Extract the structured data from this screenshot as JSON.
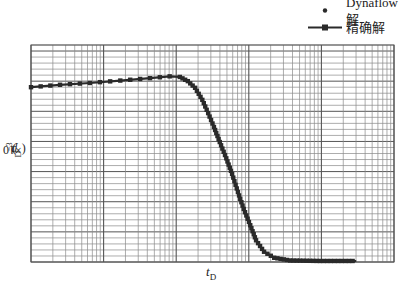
{
  "chart_data": {
    "type": "line",
    "title": "",
    "xlabel": "t_D",
    "ylabel": "p_D(×10^-3)",
    "x_scale": "log",
    "x_decades": 5,
    "x_range_log10": [
      0,
      5
    ],
    "y_range": [
      0,
      36
    ],
    "grid": true,
    "tick_labels_shown": false,
    "legend": {
      "position": "upper-right-outside",
      "entries": [
        "Dynaflow解",
        "精确解"
      ]
    },
    "series": [
      {
        "name": "精确解",
        "style": "line-with-square-markers",
        "x_log10": [
          0,
          0.4,
          0.81,
          1.23,
          1.64,
          1.91,
          2.05,
          2.16,
          2.26,
          2.36,
          2.44,
          2.52,
          2.6,
          2.69,
          2.77,
          2.85,
          2.93,
          3.02,
          3.1,
          3.21,
          3.35,
          3.57,
          3.98,
          4.48
        ],
        "y": [
          29.0,
          29.4,
          29.7,
          30.1,
          30.5,
          30.8,
          30.7,
          30.0,
          28.9,
          26.9,
          24.7,
          22.4,
          19.9,
          17.2,
          14.6,
          11.6,
          8.8,
          6.1,
          3.6,
          1.7,
          0.7,
          0.25,
          0.17,
          0.17
        ]
      },
      {
        "name": "Dynaflow解",
        "style": "diamond-markers",
        "x_log10": [
          0,
          0.4,
          0.81,
          1.23,
          1.64,
          1.91,
          2.05,
          2.16,
          2.26,
          2.36,
          2.44,
          2.52,
          2.6,
          2.69,
          2.77,
          2.85,
          2.93,
          3.02,
          3.1,
          3.21,
          3.35,
          3.57,
          3.98,
          4.48
        ],
        "y": [
          29.0,
          29.4,
          29.7,
          30.1,
          30.5,
          30.8,
          30.7,
          30.0,
          28.9,
          26.9,
          24.7,
          22.4,
          19.9,
          17.2,
          14.6,
          11.6,
          8.8,
          6.1,
          3.6,
          1.7,
          0.7,
          0.25,
          0.17,
          0.17
        ]
      }
    ]
  },
  "legend": {
    "dynaflow_label": "Dynaflow解",
    "exact_label": "精确解"
  },
  "axes": {
    "x_label_main": "t",
    "x_label_sub": "D",
    "y_label_main": "p",
    "y_label_sub": "D",
    "y_label_suffix": "(×10",
    "y_label_exp": "−3",
    "y_label_close": ")"
  },
  "colors": {
    "grid": "#8a8a8a",
    "grid_major": "#555555",
    "curve": "#2a2a2a"
  }
}
